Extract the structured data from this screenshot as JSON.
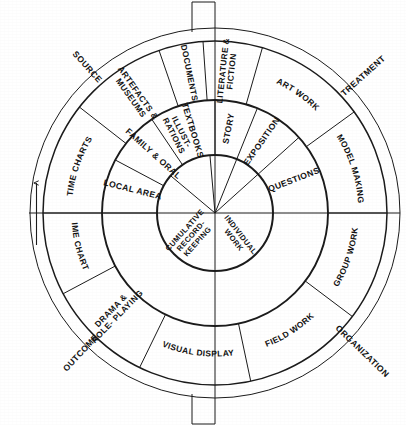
{
  "diagram": {
    "type": "concentric-wheel",
    "center": {
      "x": 215,
      "y": 213
    },
    "radii": {
      "core": 58,
      "ring1": 113,
      "ring2": 172,
      "band": 185
    },
    "colors": {
      "stroke": "#1a1a1a",
      "background": "#ffffff",
      "text": "#111111"
    },
    "axis_labels": [
      {
        "name": "source",
        "text": "SOURCE",
        "angle": -132
      },
      {
        "name": "treatment",
        "text": "TREATMENT",
        "angle": -42
      },
      {
        "name": "outcome",
        "text": "OUTCOME",
        "angle": 133
      },
      {
        "name": "organization",
        "text": "ORGANIZATION",
        "angle": 44
      }
    ],
    "outer_ring": {
      "name": "outer-ring",
      "segments": [
        {
          "name": "time-charts-upper",
          "text": "TIME CHARTS",
          "start": -180,
          "end": -142
        },
        {
          "name": "artefacts-museums",
          "text": "ARTEFACTS & MUSEUMS",
          "start": -142,
          "end": -109
        },
        {
          "name": "documents",
          "text": "DOCUMENTS",
          "start": -109,
          "end": -94
        },
        {
          "name": "literature-fiction",
          "text": "LITERATURE & FICTION",
          "start": -94,
          "end": -74
        },
        {
          "name": "art-work",
          "text": "ART WORK",
          "start": -74,
          "end": -36
        },
        {
          "name": "model-making",
          "text": "MODEL MAKING",
          "start": -36,
          "end": 0
        },
        {
          "name": "group-work",
          "text": "GROUP WORK",
          "start": 0,
          "end": 37
        },
        {
          "name": "field-work",
          "text": "FIELD WORK",
          "start": 37,
          "end": 78
        },
        {
          "name": "visual-display",
          "text": "VISUAL DISPLAY",
          "start": 78,
          "end": 116
        },
        {
          "name": "drama-role-playing",
          "text": "DRAMA & ROLE- PLAYING",
          "start": 116,
          "end": 152
        },
        {
          "name": "time-charts-lower",
          "text": "TIME CHARTS",
          "start": 152,
          "end": 180
        }
      ]
    },
    "middle_ring": {
      "name": "middle-ring",
      "segments": [
        {
          "name": "local-area",
          "text": "LOCAL AREA",
          "start": -180,
          "end": -152
        },
        {
          "name": "family-oral",
          "text": "FAMILY & ORAL",
          "start": -152,
          "end": -124
        },
        {
          "name": "textbooks",
          "text": "TEXTBOOKS",
          "start": -124,
          "end": -90
        },
        {
          "name": "story",
          "text": "STORY",
          "start": -90,
          "end": -68
        },
        {
          "name": "exposition",
          "text": "EXPOSITION",
          "start": -68,
          "end": -42
        },
        {
          "name": "questions",
          "text": "QUESTIONS",
          "start": -42,
          "end": 0
        }
      ]
    },
    "inner_circle": {
      "name": "inner-circle",
      "segments": [
        {
          "name": "illustrations",
          "text": "ILLUST- RATIONS",
          "start": -140,
          "end": -95
        },
        {
          "name": "cumulative-record-keeping",
          "text": "CUMULATIVE RECORD- KEEPING",
          "start": 0,
          "end": 180
        },
        {
          "name": "individual-work",
          "text": "INDIVIDUAL WORK",
          "start": 0,
          "end": 90
        }
      ],
      "labels": [
        {
          "name": "cumulative-record-keeping-label",
          "lines": [
            "CUMULATIVE",
            "RECORD-",
            "KEEPING"
          ]
        },
        {
          "name": "individual-work-label",
          "lines": [
            "INDIVIDUAL",
            "WORK"
          ]
        }
      ]
    },
    "arrow": {
      "name": "progression-arrow",
      "direction": "up"
    }
  }
}
